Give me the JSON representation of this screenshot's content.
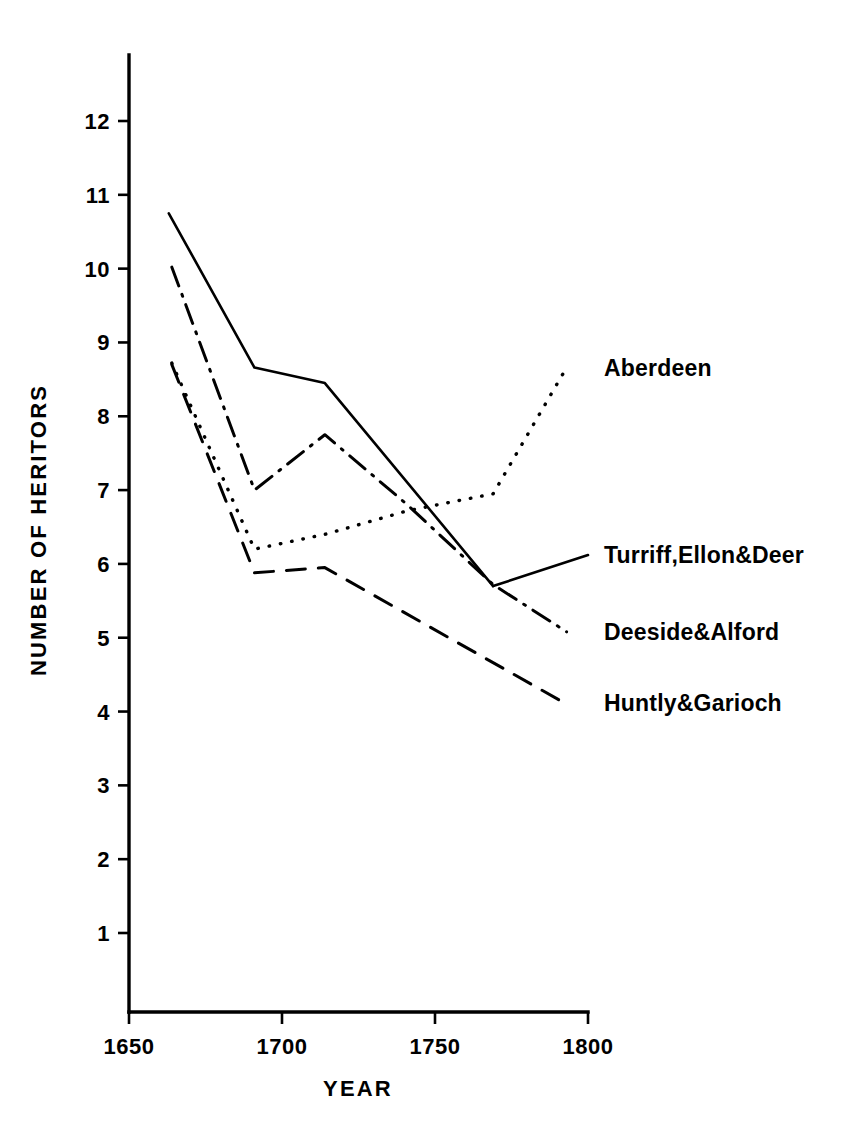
{
  "chart_data": {
    "type": "line",
    "title": "",
    "xlabel": "YEAR",
    "ylabel": "NUMBER OF HERITORS",
    "xlim": [
      1650,
      1800
    ],
    "ylim": [
      1,
      12.6
    ],
    "grid": false,
    "legend_position": "right-inline-labels",
    "x_ticks": [
      "1650",
      "1700",
      "1750",
      "1800"
    ],
    "x_tick_values": [
      1650,
      1700,
      1750,
      1800
    ],
    "y_ticks": [
      "1",
      "2",
      "3",
      "4",
      "5",
      "6",
      "7",
      "8",
      "9",
      "10",
      "11",
      "12"
    ],
    "y_tick_values": [
      1,
      2,
      3,
      4,
      5,
      6,
      7,
      8,
      9,
      10,
      11,
      12
    ],
    "series": [
      {
        "name": "Turriff,Ellon&Deer",
        "style": "solid",
        "stroke_width": 2.6,
        "dasharray": "none",
        "x": [
          1663,
          1691,
          1714,
          1769
        ],
        "values": [
          10.75,
          8.66,
          8.45,
          5.7
        ],
        "label_anchor": {
          "x": 1800,
          "y": 6.12
        },
        "leader_from": {
          "x": 1769,
          "y": 5.7
        }
      },
      {
        "name": "Deeside&Alford",
        "style": "dash-dot",
        "stroke_width": 3.0,
        "dasharray": "20 9 2 9",
        "x": [
          1664,
          1691,
          1714,
          1741,
          1769,
          1793
        ],
        "values": [
          10.02,
          7.0,
          7.75,
          6.8,
          5.72,
          5.08
        ],
        "label_anchor": {
          "x": 1800,
          "y": 5.08
        },
        "leader_from": {
          "x": 1793,
          "y": 5.08
        }
      },
      {
        "name": "Aberdeen",
        "style": "dotted",
        "stroke_width": 3.4,
        "dasharray": "0.5 11",
        "x": [
          1664,
          1691,
          1714,
          1741,
          1769,
          1793
        ],
        "values": [
          8.72,
          6.2,
          6.4,
          6.72,
          6.95,
          8.66
        ],
        "label_anchor": {
          "x": 1800,
          "y": 8.66
        },
        "leader_from": {
          "x": 1793,
          "y": 8.66
        }
      },
      {
        "name": "Huntly&Garioch",
        "style": "dashed",
        "stroke_width": 3.0,
        "dasharray": "19 13",
        "x": [
          1664,
          1691,
          1714,
          1793
        ],
        "values": [
          8.7,
          5.88,
          5.95,
          4.1
        ],
        "label_anchor": {
          "x": 1800,
          "y": 4.12
        },
        "leader_from": {
          "x": 1793,
          "y": 4.1
        }
      }
    ]
  },
  "colors": {
    "ink": "#000000",
    "background": "#ffffff"
  }
}
